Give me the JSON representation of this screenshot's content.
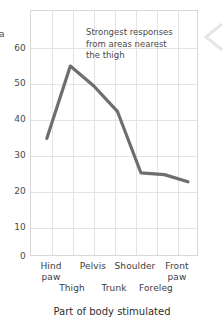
{
  "chart_data": {
    "type": "line",
    "title": "",
    "xlabel": "Part of body stimulated",
    "ylabel": "a",
    "categories": [
      "Hind paw",
      "Thigh",
      "Pelvis",
      "Trunk",
      "Shoulder",
      "Foreleg",
      "Front paw"
    ],
    "values": [
      32.5,
      52.5,
      47,
      40,
      23,
      22.5,
      20.5
    ],
    "series": [
      {
        "name": "Response",
        "values": [
          32.5,
          52.5,
          47,
          40,
          23,
          22.5,
          20.5
        ]
      }
    ],
    "ylim": [
      0,
      68
    ],
    "yticks": [
      0,
      10,
      20,
      30,
      40,
      50,
      60
    ],
    "ytick_labels": [
      "0",
      "10",
      "20",
      "30",
      "40",
      "50",
      "60"
    ],
    "grid": true,
    "legend": "none",
    "line_color": "#6e6e6e",
    "grid_color": "#e4e4e4",
    "annotations": [
      {
        "text": "Strongest responses\nfrom areas nearest\nthe thigh",
        "x": "Pelvis",
        "y": 63
      }
    ]
  },
  "axis": {
    "y_tick_labels": [
      "60",
      "50",
      "40",
      "30",
      "20",
      "10",
      "0"
    ],
    "y_axis_label_partial": "a",
    "x_labels_top_row": [
      "Hind\npaw",
      "Pelvis",
      "Shoulder",
      "Front\npaw"
    ],
    "x_labels_bottom_row": [
      "Thigh",
      "Trunk",
      "Foreleg"
    ],
    "x_axis_title": "Part of body stimulated"
  },
  "annotation": {
    "line1": "Strongest responses",
    "line2": "from areas nearest",
    "line3": "the thigh",
    "full": "Strongest responses\nfrom areas nearest\nthe thigh"
  },
  "colors": {
    "line": "#6e6e6e",
    "grid": "#e4e4e4",
    "frame": "#d8d8d8",
    "text": "#3c3c3c",
    "background": "#ffffff"
  },
  "icons": {
    "edge_chevron": "chevron-left-icon"
  }
}
